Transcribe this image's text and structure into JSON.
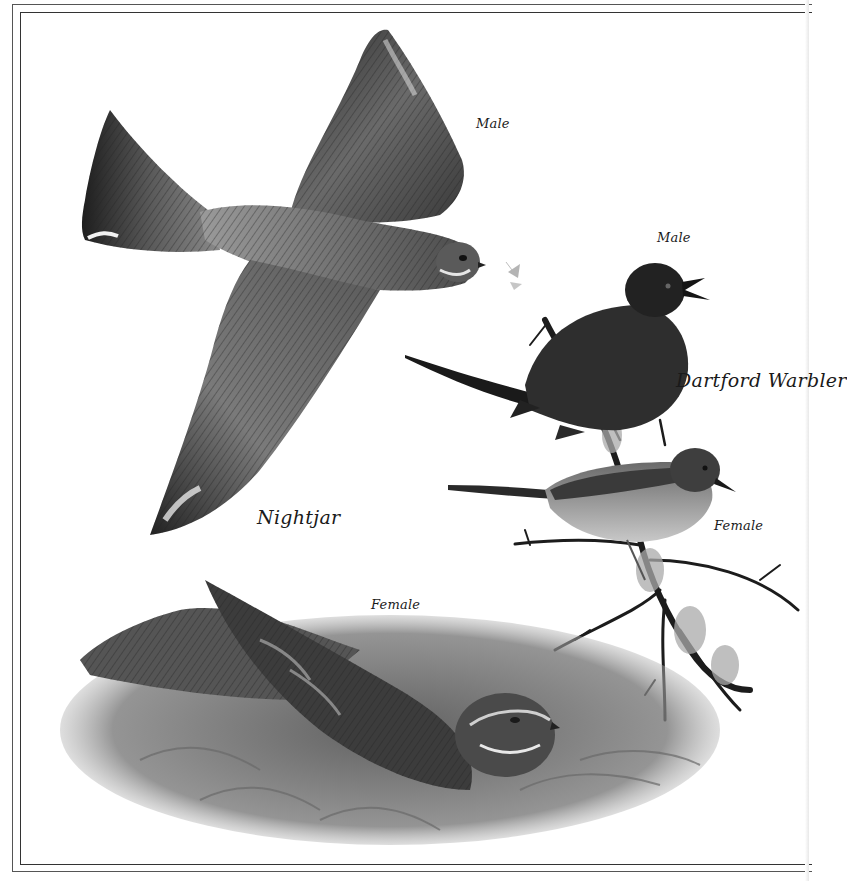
{
  "plate": {
    "labels": {
      "nightjar_male": "Male",
      "warbler_male": "Male",
      "warbler_species": "Dartford Warbler",
      "warbler_female": "Female",
      "nightjar_species": "Nightjar",
      "nightjar_female": "Female"
    },
    "subjects": [
      {
        "species": "Nightjar",
        "sex": "Male",
        "pose": "flying, catching moth"
      },
      {
        "species": "Dartford Warbler",
        "sex": "Male",
        "pose": "perched, singing"
      },
      {
        "species": "Dartford Warbler",
        "sex": "Female",
        "pose": "perched"
      },
      {
        "species": "Nightjar",
        "sex": "Female",
        "pose": "resting on ground among ferns"
      }
    ],
    "colors": {
      "paper": "#ffffff",
      "ink": "#1a1a1a",
      "border": "#444444"
    }
  }
}
